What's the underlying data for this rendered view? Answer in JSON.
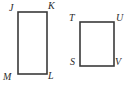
{
  "figure": {
    "type": "geometry-diagram",
    "canvas": {
      "width": 130,
      "height": 88,
      "background": "#ffffff"
    },
    "stroke_color": "#3a3a3a",
    "label_color": "#2b2b2b",
    "stroke_width": 1.6,
    "shapes": [
      {
        "name": "rectangle-jklm",
        "vertex_order": [
          "J",
          "K",
          "L",
          "M"
        ],
        "x": 18,
        "y": 12,
        "width": 29,
        "height": 62,
        "labels": [
          {
            "text": "J",
            "vertex": "top-left",
            "x": 9,
            "y": 3
          },
          {
            "text": "K",
            "vertex": "top-right",
            "x": 48,
            "y": 1
          },
          {
            "text": "L",
            "vertex": "bottom-right",
            "x": 48,
            "y": 71
          },
          {
            "text": "M",
            "vertex": "bottom-left",
            "x": 3,
            "y": 72
          }
        ]
      },
      {
        "name": "rectangle-tuvs",
        "vertex_order": [
          "T",
          "U",
          "V",
          "S"
        ],
        "x": 80,
        "y": 22,
        "width": 34,
        "height": 44,
        "labels": [
          {
            "text": "T",
            "vertex": "top-left",
            "x": 69,
            "y": 13
          },
          {
            "text": "U",
            "vertex": "top-right",
            "x": 116,
            "y": 13
          },
          {
            "text": "V",
            "vertex": "bottom-right",
            "x": 115,
            "y": 57
          },
          {
            "text": "S",
            "vertex": "bottom-left",
            "x": 70,
            "y": 57
          }
        ]
      }
    ]
  }
}
